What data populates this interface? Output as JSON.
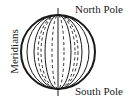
{
  "diagram": {
    "labels": {
      "north_pole": "North Pole",
      "south_pole": "South Pole",
      "meridians": "Meridians"
    },
    "colors": {
      "stroke": "#1a1a1a",
      "background": "#ffffff"
    },
    "globe": {
      "cx": 58,
      "cy": 52,
      "r": 37,
      "axis_top_y": 8,
      "axis_bottom_y": 96,
      "meridian_half_widths_solid": [
        31,
        24,
        13
      ],
      "meridian_half_widths_dashed": [
        20,
        6,
        17
      ]
    }
  }
}
